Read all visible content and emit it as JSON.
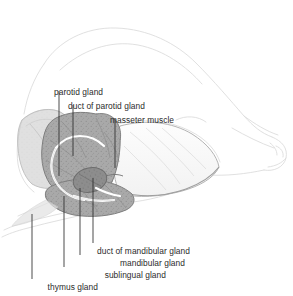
{
  "figure": {
    "background_color": "#ffffff",
    "ink_color": "#2b2b2b",
    "outline_color": "#d8d8d8",
    "gland_fill": "#a7a7a7",
    "gland_dark_fill": "#8a8a8a",
    "muscle_fill": "#fbfbfb",
    "duct_color": "#ffffff"
  },
  "labels": [
    {
      "id": "parotid-gland",
      "text": "parotid gland",
      "x": 54,
      "y": 88,
      "align": "left",
      "leader": {
        "x1": 59,
        "y1": 91,
        "x2": 59,
        "y2": 176
      }
    },
    {
      "id": "duct-of-parotid-gland",
      "text": "duct of parotid gland",
      "x": 68,
      "y": 102,
      "align": "left",
      "leader": {
        "x1": 73,
        "y1": 105,
        "x2": 73,
        "y2": 156
      }
    },
    {
      "id": "masseter-muscle",
      "text": "masseter muscle",
      "x": 110,
      "y": 116,
      "align": "left",
      "leader": {
        "x1": 115,
        "y1": 119,
        "x2": 115,
        "y2": 168
      }
    },
    {
      "id": "duct-of-mandibular-gland",
      "text": "duct of mandibular gland",
      "x": 97,
      "y": 247,
      "align": "left",
      "leader": {
        "x1": 93,
        "y1": 178,
        "x2": 93,
        "y2": 243
      }
    },
    {
      "id": "mandibular-gland",
      "text": "mandibular gland",
      "x": 185,
      "y": 259,
      "align": "right",
      "leader": {
        "x1": 80,
        "y1": 188,
        "x2": 80,
        "y2": 255
      }
    },
    {
      "id": "sublingual-gland",
      "text": "sublingual gland",
      "x": 166,
      "y": 271,
      "align": "right",
      "leader": {
        "x1": 64,
        "y1": 196,
        "x2": 64,
        "y2": 267
      }
    },
    {
      "id": "thymus-gland",
      "text": "thymus gland",
      "x": 98,
      "y": 283,
      "align": "right",
      "leader": {
        "x1": 32,
        "y1": 214,
        "x2": 32,
        "y2": 279
      }
    }
  ]
}
